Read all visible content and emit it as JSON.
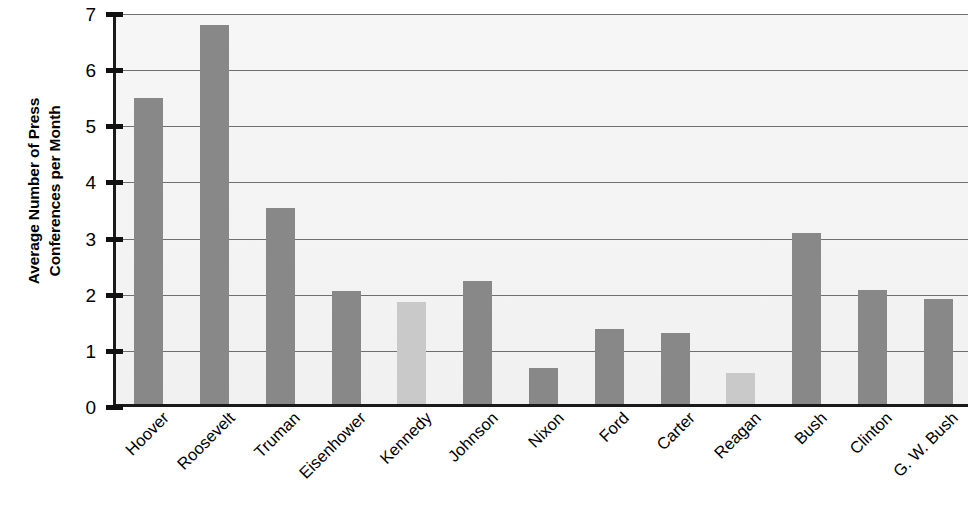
{
  "chart_data": {
    "type": "bar",
    "title": "",
    "xlabel": "",
    "ylabel": "Average Number of Press\nConferences per Month",
    "ylim": [
      0,
      7
    ],
    "yticks": [
      0,
      1,
      2,
      3,
      4,
      5,
      6,
      7
    ],
    "ytick_labels": [
      "0",
      "1",
      "2",
      "3",
      "4",
      "5",
      "6",
      "7"
    ],
    "grid": true,
    "legend": "none",
    "categories": [
      "Hoover",
      "Roosevelt",
      "Truman",
      "Eisenhower",
      "Kennedy",
      "Johnson",
      "Nixon",
      "Ford",
      "Carter",
      "Reagan",
      "Bush",
      "Clinton",
      "G. W. Bush"
    ],
    "values": [
      5.45,
      6.75,
      3.5,
      2.02,
      1.82,
      2.2,
      0.65,
      1.33,
      1.26,
      0.55,
      3.05,
      2.03,
      1.87
    ],
    "bar_colors": [
      "#888888",
      "#888888",
      "#888888",
      "#888888",
      "#c9c9c9",
      "#888888",
      "#888888",
      "#888888",
      "#888888",
      "#c9c9c9",
      "#888888",
      "#888888",
      "#888888"
    ],
    "colors": {
      "bar_dark": "#888888",
      "bar_light": "#c9c9c9",
      "axis": "#1a1a1a",
      "gridline": "#6f6f6f",
      "plot_background": "#f3f3f3",
      "text": "#000000"
    }
  }
}
